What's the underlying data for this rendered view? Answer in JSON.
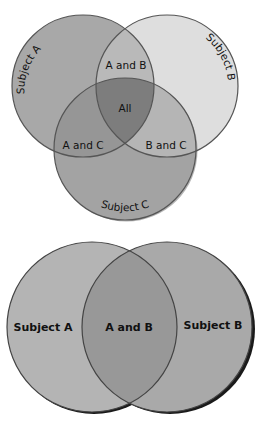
{
  "diagrams": {
    "three_set": {
      "circles": {
        "a": {
          "label": "Subject A",
          "fill": "#a8a8a8"
        },
        "b": {
          "label": "Subject B",
          "fill": "#dedede"
        },
        "c": {
          "label": "Subject C",
          "fill": "#a3a3a3"
        }
      },
      "regions": {
        "ab": "A and B",
        "ac": "A and C",
        "bc": "B and C",
        "abc": "All"
      },
      "colors": {
        "ab": "#b9b9b9",
        "ac": "#969696",
        "bc": "#b5b5b5",
        "abc": "#7d7d7d",
        "stroke": "#555555"
      }
    },
    "two_set": {
      "circles": {
        "a": {
          "label": "Subject A",
          "fill": "#b4b4b4"
        },
        "b": {
          "label": "Subject B",
          "fill": "#a9a9a9"
        }
      },
      "regions": {
        "ab": "A and B"
      },
      "colors": {
        "ab": "#989898",
        "stroke": "#444444",
        "shadow": "#1a1a1a"
      }
    }
  }
}
